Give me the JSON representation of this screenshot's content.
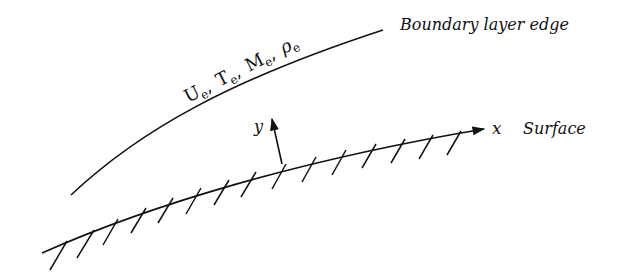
{
  "diagram": {
    "labels": {
      "boundary_edge": "Boundary layer edge",
      "surface": "Surface",
      "x_axis": "x",
      "y_axis": "y",
      "edge_props": {
        "U": "U",
        "U_sub": "e",
        "T": "T",
        "T_sub": "e",
        "M": "M",
        "M_sub": "e",
        "rho": "ρ",
        "rho_sub": "e",
        "sep": ","
      }
    },
    "colors": {
      "stroke": "#111111",
      "background": "#ffffff"
    }
  }
}
